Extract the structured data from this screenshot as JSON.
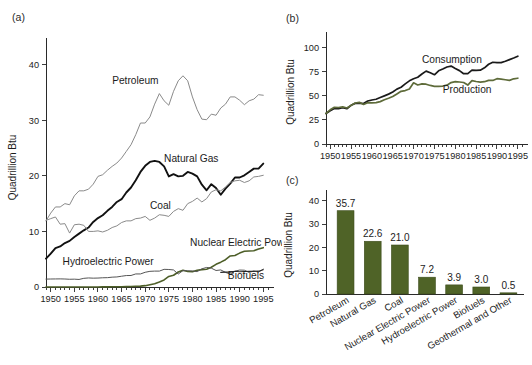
{
  "figure": {
    "panel_a_tag": "(a)",
    "panel_b_tag": "(b)",
    "panel_c_tag": "(c)"
  },
  "chart_data": [
    {
      "id": "panel-a",
      "type": "line",
      "title": "",
      "xlabel": "",
      "ylabel": "Quadrillion Btu",
      "xlim": [
        1949,
        1996
      ],
      "ylim": [
        0,
        43
      ],
      "yticks": [
        0,
        10,
        20,
        30,
        40
      ],
      "xticks": [
        1950,
        1955,
        1960,
        1965,
        1970,
        1975,
        1980,
        1985,
        1990,
        1995
      ],
      "xtick_labels": [
        "1950",
        "1955",
        "1960",
        "1965",
        "1970",
        "1975",
        "1980",
        "1985",
        "1990",
        "1995"
      ],
      "ytick_labels": [
        "0",
        "10",
        "20",
        "30",
        "40"
      ],
      "minor_tick_step": 1,
      "grid": false,
      "legend": "inline-annotations",
      "x": [
        1949,
        1950,
        1951,
        1952,
        1953,
        1954,
        1955,
        1956,
        1957,
        1958,
        1959,
        1960,
        1961,
        1962,
        1963,
        1964,
        1965,
        1966,
        1967,
        1968,
        1969,
        1970,
        1971,
        1972,
        1973,
        1974,
        1975,
        1976,
        1977,
        1978,
        1979,
        1980,
        1981,
        1982,
        1983,
        1984,
        1985,
        1986,
        1987,
        1988,
        1989,
        1990,
        1991,
        1992,
        1993,
        1994,
        1995
      ],
      "series": [
        {
          "name": "Petroleum",
          "color": "#8a8a8a",
          "width": 1.0,
          "label_x": 1963.0,
          "label_y": 36.6,
          "values": [
            11.9,
            13.3,
            14.4,
            14.4,
            15.0,
            14.8,
            16.4,
            17.3,
            17.3,
            17.6,
            18.5,
            19.9,
            20.2,
            21.0,
            21.7,
            22.3,
            23.2,
            24.4,
            25.6,
            27.4,
            29.5,
            29.5,
            30.6,
            32.9,
            34.8,
            33.5,
            32.7,
            35.2,
            37.1,
            38.0,
            37.1,
            34.2,
            31.9,
            30.2,
            30.1,
            31.1,
            30.9,
            32.2,
            32.9,
            34.2,
            34.2,
            33.6,
            32.8,
            33.5,
            33.8,
            34.6,
            34.5
          ]
        },
        {
          "name": "Natural Gas",
          "color": "#111111",
          "width": 1.9,
          "label_x": 1974.0,
          "label_y": 22.4,
          "values": [
            5.1,
            6.0,
            7.0,
            7.3,
            7.9,
            8.3,
            9.0,
            9.6,
            10.2,
            10.7,
            11.7,
            12.4,
            12.9,
            13.7,
            14.4,
            15.3,
            15.8,
            17.0,
            17.9,
            19.2,
            20.7,
            21.8,
            22.5,
            22.7,
            22.5,
            21.7,
            19.9,
            20.3,
            19.9,
            20.0,
            20.7,
            20.4,
            19.9,
            18.4,
            17.4,
            18.5,
            17.8,
            16.6,
            17.7,
            18.6,
            19.7,
            19.7,
            20.1,
            20.7,
            21.3,
            21.3,
            22.2
          ]
        },
        {
          "name": "Coal",
          "color": "#8a8a8a",
          "width": 1.0,
          "label_x": 1971.0,
          "label_y": 14.1,
          "values": [
            12.0,
            12.3,
            12.6,
            11.3,
            11.4,
            9.7,
            11.2,
            11.3,
            11.1,
            10.0,
            10.0,
            10.1,
            9.9,
            10.2,
            10.7,
            11.0,
            11.6,
            11.9,
            11.9,
            12.3,
            12.4,
            12.7,
            12.0,
            12.4,
            13.0,
            12.9,
            12.7,
            13.6,
            14.1,
            13.8,
            15.0,
            15.4,
            16.0,
            15.3,
            15.9,
            17.1,
            17.5,
            17.3,
            18.0,
            18.8,
            19.1,
            19.2,
            18.8,
            19.1,
            19.8,
            19.9,
            20.1
          ]
        },
        {
          "name": "Nuclear Electric Power",
          "color": "#4d5e28",
          "width": 1.6,
          "label_x": 1979.5,
          "label_y": 7.4,
          "values": [
            0,
            0,
            0,
            0,
            0,
            0,
            0,
            0,
            0,
            0,
            0.01,
            0.01,
            0.02,
            0.03,
            0.04,
            0.04,
            0.04,
            0.06,
            0.09,
            0.14,
            0.15,
            0.24,
            0.41,
            0.58,
            0.91,
            1.27,
            1.9,
            2.11,
            2.7,
            3.02,
            2.78,
            2.74,
            3.01,
            3.13,
            3.2,
            3.55,
            4.08,
            4.47,
            4.91,
            5.59,
            5.68,
            6.1,
            6.42,
            6.48,
            6.52,
            6.84,
            7.08
          ]
        },
        {
          "name": "Hydroelectric Power",
          "color": "#555555",
          "width": 1.0,
          "label_x": 1952.5,
          "label_y": 4.0,
          "values": [
            1.42,
            1.44,
            1.45,
            1.46,
            1.44,
            1.39,
            1.41,
            1.36,
            1.56,
            1.63,
            1.59,
            1.61,
            1.66,
            1.68,
            1.77,
            1.81,
            1.94,
            2.06,
            2.07,
            2.35,
            2.35,
            2.65,
            2.82,
            2.86,
            2.86,
            3.18,
            3.15,
            3.07,
            2.34,
            2.95,
            2.93,
            2.9,
            2.76,
            3.27,
            3.52,
            3.39,
            2.97,
            3.07,
            2.63,
            2.33,
            2.84,
            3.05,
            3.02,
            2.62,
            2.89,
            2.68,
            3.21
          ]
        },
        {
          "name": "Biofuels",
          "color": "#2a2a2a",
          "width": 1.1,
          "label_x": 1987.5,
          "label_y": 1.5,
          "values": [
            null,
            null,
            null,
            null,
            null,
            null,
            null,
            null,
            null,
            null,
            null,
            null,
            null,
            null,
            null,
            null,
            null,
            null,
            null,
            null,
            null,
            null,
            null,
            null,
            null,
            null,
            null,
            null,
            null,
            null,
            null,
            null,
            null,
            null,
            null,
            null,
            null,
            2.63,
            2.68,
            2.68,
            2.83,
            2.74,
            2.78,
            2.82,
            2.82,
            2.85,
            3.1
          ]
        }
      ]
    },
    {
      "id": "panel-b",
      "type": "line",
      "title": "",
      "xlabel": "",
      "ylabel": "Quadrillion Btu",
      "xlim": [
        1949,
        1996
      ],
      "ylim": [
        0,
        108
      ],
      "yticks": [
        0,
        25,
        50,
        75,
        100
      ],
      "ytick_labels": [
        "0",
        "25",
        "50",
        "75",
        "100"
      ],
      "xticks": [
        1950,
        1955,
        1960,
        1965,
        1970,
        1975,
        1980,
        1985,
        1990,
        1995
      ],
      "xtick_labels": [
        "1950",
        "1955",
        "1960",
        "1965",
        "1970",
        "1975",
        "1980",
        "1985",
        "1990",
        "1995"
      ],
      "minor_tick_step": 1,
      "grid": false,
      "legend": "inline-annotations",
      "x": [
        1949,
        1950,
        1951,
        1952,
        1953,
        1954,
        1955,
        1956,
        1957,
        1958,
        1959,
        1960,
        1961,
        1962,
        1963,
        1964,
        1965,
        1966,
        1967,
        1968,
        1969,
        1970,
        1971,
        1972,
        1973,
        1974,
        1975,
        1976,
        1977,
        1978,
        1979,
        1980,
        1981,
        1982,
        1983,
        1984,
        1985,
        1986,
        1987,
        1988,
        1989,
        1990,
        1991,
        1992,
        1993,
        1994,
        1995
      ],
      "series": [
        {
          "name": "Consumption",
          "color": "#1a1a1a",
          "width": 1.7,
          "label_x": 1972.0,
          "label_y": 84.0,
          "values": [
            31.6,
            34.6,
            36.9,
            36.7,
            37.7,
            36.6,
            40.2,
            42.2,
            42.4,
            42.0,
            44.6,
            45.7,
            46.5,
            48.3,
            50.0,
            51.8,
            54.0,
            57.0,
            58.9,
            62.4,
            65.6,
            67.8,
            69.3,
            72.7,
            75.7,
            73.9,
            71.9,
            76.0,
            77.9,
            80.0,
            80.9,
            78.3,
            76.2,
            73.0,
            73.1,
            76.7,
            76.4,
            76.7,
            79.1,
            82.8,
            84.9,
            84.6,
            84.5,
            85.9,
            87.6,
            89.3,
            91.2
          ]
        },
        {
          "name": "Production",
          "color": "#5e6b3a",
          "width": 1.7,
          "label_x": 1977.0,
          "label_y": 53.0,
          "values": [
            31.7,
            35.5,
            38.1,
            37.9,
            38.5,
            37.4,
            40.1,
            42.6,
            43.3,
            41.1,
            42.9,
            42.8,
            43.0,
            44.0,
            45.9,
            47.5,
            49.3,
            52.0,
            54.7,
            55.5,
            57.1,
            63.5,
            61.3,
            62.4,
            62.1,
            60.8,
            59.9,
            59.9,
            60.2,
            61.1,
            63.8,
            64.8,
            64.4,
            63.9,
            61.2,
            65.8,
            64.9,
            64.3,
            64.7,
            66.1,
            66.0,
            67.8,
            67.4,
            66.7,
            66.1,
            67.7,
            68.3
          ]
        }
      ]
    },
    {
      "id": "panel-c",
      "type": "bar",
      "title": "",
      "xlabel": "",
      "ylabel": "Quadrillion Btu",
      "ylim": [
        0,
        42
      ],
      "yticks": [
        0,
        10,
        20,
        30,
        40
      ],
      "ytick_labels": [
        "0",
        "10",
        "20",
        "30",
        "40"
      ],
      "grid": false,
      "bar_color": "#4f6327",
      "categories": [
        "Petroleum",
        "Natural Gas",
        "Coal",
        "Nuclear Electric Power",
        "Hydroelectric Power",
        "Biofuels",
        "Geothermal and Other"
      ],
      "values": [
        35.7,
        22.6,
        21.0,
        7.2,
        3.9,
        3.0,
        0.5
      ],
      "value_labels": [
        "35.7",
        "22.6",
        "21.0",
        "7.2",
        "3.9",
        "3.0",
        "0.5"
      ]
    }
  ]
}
